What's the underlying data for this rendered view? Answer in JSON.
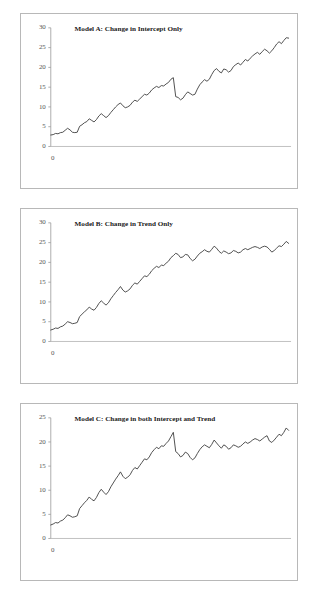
{
  "figure": {
    "background_color": "#ffffff",
    "panel_border_color": "#b8b8b8",
    "line_color": "#3d3d3d",
    "axis_color": "#9a9a9a"
  },
  "chart_data": [
    {
      "type": "line",
      "id": "model-a",
      "title": "Model A: Change in Intercept Only",
      "xlabel": "",
      "ylabel": "",
      "xlim": [
        0,
        100
      ],
      "ylim": [
        0,
        30
      ],
      "yticks": [
        0,
        5,
        10,
        15,
        20,
        25,
        30
      ],
      "xticks": [
        0
      ],
      "xticklabels": [
        "0"
      ],
      "grid": false,
      "legend": false,
      "break_point": 52,
      "series": [
        {
          "name": "y",
          "x": [
            0,
            1,
            2,
            3,
            4,
            5,
            6,
            7,
            8,
            9,
            10,
            11,
            12,
            13,
            14,
            15,
            16,
            17,
            18,
            19,
            20,
            21,
            22,
            23,
            24,
            25,
            26,
            27,
            28,
            29,
            30,
            31,
            32,
            33,
            34,
            35,
            36,
            37,
            38,
            39,
            40,
            41,
            42,
            43,
            44,
            45,
            46,
            47,
            48,
            49,
            50,
            51,
            52,
            53,
            54,
            55,
            56,
            57,
            58,
            59,
            60,
            61,
            62,
            63,
            64,
            65,
            66,
            67,
            68,
            69,
            70,
            71,
            72,
            73,
            74,
            75,
            76,
            77,
            78,
            79,
            80,
            81,
            82,
            83,
            84,
            85,
            86,
            87,
            88,
            89,
            90,
            91,
            92,
            93,
            94,
            95,
            96,
            97,
            98,
            99
          ],
          "values": [
            2.9,
            3.0,
            3.3,
            3.2,
            3.5,
            3.6,
            4.1,
            4.6,
            4.2,
            3.6,
            3.5,
            3.6,
            5.1,
            5.5,
            6.0,
            6.3,
            7.0,
            6.6,
            6.2,
            6.8,
            7.7,
            8.3,
            7.8,
            7.3,
            7.8,
            8.6,
            9.3,
            10.0,
            10.6,
            11.0,
            10.3,
            9.8,
            10.0,
            10.4,
            11.2,
            11.7,
            11.4,
            12.0,
            12.6,
            13.2,
            13.0,
            13.5,
            14.3,
            14.8,
            15.2,
            14.9,
            15.4,
            15.3,
            15.8,
            16.2,
            17.0,
            17.4,
            12.6,
            12.4,
            11.8,
            12.2,
            13.1,
            13.8,
            13.4,
            13.0,
            13.2,
            14.5,
            15.6,
            16.3,
            16.9,
            16.5,
            17.0,
            18.2,
            19.2,
            19.7,
            19.0,
            18.6,
            19.6,
            19.4,
            18.8,
            19.2,
            20.2,
            20.7,
            21.1,
            20.6,
            21.3,
            22.0,
            21.6,
            22.3,
            22.9,
            23.4,
            23.8,
            23.3,
            24.0,
            24.6,
            24.2,
            23.6,
            24.2,
            25.0,
            25.9,
            26.5,
            26.0,
            26.8,
            27.5,
            27.4
          ]
        }
      ]
    },
    {
      "type": "line",
      "id": "model-b",
      "title": "Model B: Change in Trend Only",
      "xlabel": "",
      "ylabel": "",
      "xlim": [
        0,
        100
      ],
      "ylim": [
        0,
        30
      ],
      "yticks": [
        0,
        5,
        10,
        15,
        20,
        25,
        30
      ],
      "xticks": [
        0
      ],
      "xticklabels": [
        "0"
      ],
      "grid": false,
      "legend": false,
      "break_point": 52,
      "series": [
        {
          "name": "y",
          "x": [
            0,
            1,
            2,
            3,
            4,
            5,
            6,
            7,
            8,
            9,
            10,
            11,
            12,
            13,
            14,
            15,
            16,
            17,
            18,
            19,
            20,
            21,
            22,
            23,
            24,
            25,
            26,
            27,
            28,
            29,
            30,
            31,
            32,
            33,
            34,
            35,
            36,
            37,
            38,
            39,
            40,
            41,
            42,
            43,
            44,
            45,
            46,
            47,
            48,
            49,
            50,
            51,
            52,
            53,
            54,
            55,
            56,
            57,
            58,
            59,
            60,
            61,
            62,
            63,
            64,
            65,
            66,
            67,
            68,
            69,
            70,
            71,
            72,
            73,
            74,
            75,
            76,
            77,
            78,
            79,
            80,
            81,
            82,
            83,
            84,
            85,
            86,
            87,
            88,
            89,
            90,
            91,
            92,
            93,
            94,
            95,
            96,
            97,
            98,
            99
          ],
          "values": [
            2.9,
            3.1,
            3.4,
            3.3,
            3.7,
            3.9,
            4.4,
            5.0,
            4.8,
            4.5,
            4.6,
            4.8,
            6.3,
            6.9,
            7.5,
            8.0,
            8.7,
            8.2,
            7.9,
            8.6,
            9.6,
            10.3,
            9.7,
            9.2,
            9.8,
            10.8,
            11.6,
            12.4,
            13.1,
            13.9,
            13.0,
            12.5,
            12.8,
            13.3,
            14.2,
            14.8,
            14.5,
            15.2,
            15.9,
            16.6,
            16.4,
            17.0,
            17.9,
            18.5,
            19.0,
            18.7,
            19.3,
            19.2,
            19.8,
            20.3,
            21.2,
            21.7,
            22.3,
            22.0,
            21.2,
            21.4,
            22.0,
            21.9,
            21.0,
            20.4,
            20.8,
            21.6,
            22.3,
            22.7,
            23.2,
            22.8,
            22.6,
            23.3,
            24.1,
            23.6,
            22.8,
            22.3,
            22.9,
            22.6,
            22.2,
            22.4,
            23.0,
            22.8,
            22.4,
            22.6,
            23.2,
            23.5,
            23.2,
            23.5,
            23.8,
            24.0,
            23.8,
            23.5,
            23.9,
            24.1,
            23.9,
            23.3,
            22.6,
            23.0,
            23.6,
            24.2,
            24.0,
            24.6,
            25.3,
            24.8
          ]
        }
      ]
    },
    {
      "type": "line",
      "id": "model-c",
      "title": "Model C: Change in both Intercept and Trend",
      "xlabel": "",
      "ylabel": "",
      "xlim": [
        0,
        100
      ],
      "ylim": [
        0,
        25
      ],
      "yticks": [
        0,
        5,
        10,
        15,
        20,
        25
      ],
      "xticks": [
        0
      ],
      "xticklabels": [
        "0"
      ],
      "grid": false,
      "legend": false,
      "break_point": 52,
      "series": [
        {
          "name": "y",
          "x": [
            0,
            1,
            2,
            3,
            4,
            5,
            6,
            7,
            8,
            9,
            10,
            11,
            12,
            13,
            14,
            15,
            16,
            17,
            18,
            19,
            20,
            21,
            22,
            23,
            24,
            25,
            26,
            27,
            28,
            29,
            30,
            31,
            32,
            33,
            34,
            35,
            36,
            37,
            38,
            39,
            40,
            41,
            42,
            43,
            44,
            45,
            46,
            47,
            48,
            49,
            50,
            51,
            52,
            53,
            54,
            55,
            56,
            57,
            58,
            59,
            60,
            61,
            62,
            63,
            64,
            65,
            66,
            67,
            68,
            69,
            70,
            71,
            72,
            73,
            74,
            75,
            76,
            77,
            78,
            79,
            80,
            81,
            82,
            83,
            84,
            85,
            86,
            87,
            88,
            89,
            90,
            91,
            92,
            93,
            94,
            95,
            96,
            97,
            98,
            99
          ],
          "values": [
            2.8,
            3.0,
            3.3,
            3.2,
            3.6,
            3.8,
            4.3,
            4.9,
            4.7,
            4.4,
            4.5,
            4.7,
            6.2,
            6.8,
            7.4,
            7.9,
            8.6,
            8.1,
            7.8,
            8.5,
            9.5,
            10.2,
            9.6,
            9.1,
            9.7,
            10.7,
            11.5,
            12.3,
            13.0,
            13.8,
            12.9,
            12.4,
            12.7,
            13.2,
            14.1,
            14.7,
            14.4,
            15.1,
            15.8,
            16.5,
            16.3,
            16.9,
            17.8,
            18.4,
            18.9,
            18.6,
            19.2,
            19.1,
            19.7,
            20.2,
            21.1,
            22.0,
            18.0,
            17.6,
            16.9,
            17.2,
            17.9,
            17.6,
            16.8,
            16.3,
            16.7,
            17.6,
            18.4,
            19.0,
            19.4,
            19.1,
            18.8,
            19.5,
            20.4,
            19.8,
            19.2,
            18.7,
            19.4,
            19.1,
            18.5,
            18.8,
            19.4,
            19.2,
            18.9,
            19.1,
            19.6,
            20.0,
            19.7,
            20.0,
            20.4,
            20.7,
            20.5,
            20.2,
            20.6,
            21.0,
            21.3,
            20.2,
            19.9,
            20.4,
            21.0,
            21.6,
            21.3,
            22.0,
            22.9,
            22.4
          ]
        }
      ]
    }
  ]
}
